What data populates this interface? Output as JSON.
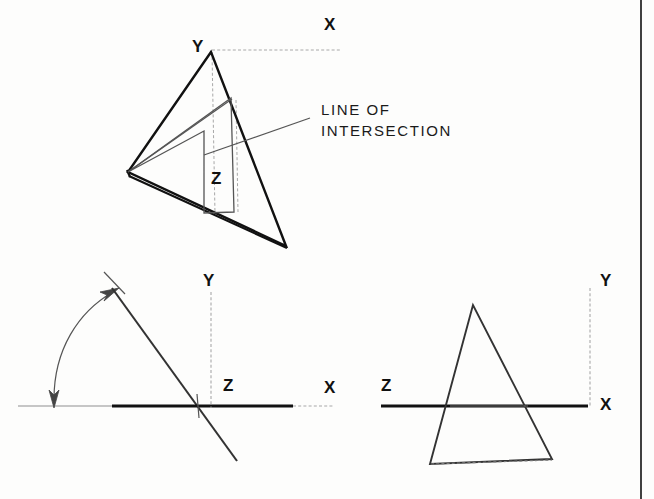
{
  "drawing": {
    "title": "Line of intersection of two planes — pictorial and orthographic views",
    "annotation": {
      "text_line1": "LINE OF",
      "text_line2": "INTERSECTION"
    },
    "pictorial_view": {
      "labels": {
        "y_apex": "Y",
        "x_axis": "X",
        "z_plane": "Z"
      }
    },
    "front_view": {
      "labels": {
        "y_axis": "Y",
        "z_axis": "Z",
        "x_axis": "X"
      }
    },
    "auxiliary_view": {
      "labels": {
        "y_axis": "Y",
        "z_axis": "Z",
        "x_axis": "X"
      }
    },
    "colors": {
      "object_line": "#111111",
      "thin_line": "#555555",
      "hidden_line": "#9a9a9a",
      "background": "#fdfdfc"
    }
  }
}
